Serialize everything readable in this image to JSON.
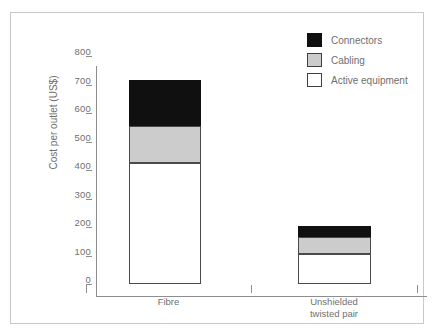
{
  "chart_data": {
    "type": "bar",
    "subtype": "stacked",
    "title": "",
    "xlabel": "",
    "ylabel": "Cost per outlet (US$)",
    "categories": [
      "Fibre",
      "Unshielded twisted pair"
    ],
    "category_lines": [
      [
        "Fibre"
      ],
      [
        "Unshielded",
        "twisted pair"
      ]
    ],
    "series": [
      {
        "name": "Active equipment",
        "color": "#ffffff",
        "values": [
          425,
          105
        ]
      },
      {
        "name": "Cabling",
        "color": "#cccccc",
        "values": [
          130,
          60
        ]
      },
      {
        "name": "Connectors",
        "color": "#101010",
        "values": [
          160,
          40
        ]
      }
    ],
    "totals": [
      715,
      205
    ],
    "ylim": [
      0,
      800
    ],
    "ytick_values": [
      0,
      100,
      200,
      300,
      400,
      500,
      600,
      700,
      800
    ],
    "ytick_labels": [
      "0",
      "100",
      "200",
      "300",
      "400",
      "500",
      "600",
      "700",
      "800"
    ],
    "grid": false,
    "legend_position": "top-right",
    "legend_entries": [
      "Connectors",
      "Cabling",
      "Active equipment"
    ],
    "axis_color": "#8d8d8d",
    "text_color": "#6f6f6f",
    "frame_color": "#c9c9c9"
  }
}
